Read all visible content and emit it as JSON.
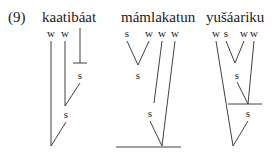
{
  "example_number": "(9)",
  "trees": [
    {
      "word": "kaatibáat",
      "word_pos": {
        "x": 42,
        "y": 9
      },
      "nodes": [
        {
          "label": "w",
          "x": 51,
          "y": 27
        },
        {
          "label": "w",
          "x": 65,
          "y": 27
        },
        {
          "label": "s",
          "x": 80,
          "y": 69
        },
        {
          "label": "s",
          "x": 66,
          "y": 108
        }
      ],
      "edges": [
        [
          80,
          28,
          80,
          63
        ],
        [
          73,
          63,
          87,
          63
        ],
        [
          51,
          41,
          51,
          146
        ],
        [
          65,
          41,
          65,
          106
        ],
        [
          80,
          83,
          65,
          106
        ],
        [
          66,
          122,
          51,
          146
        ]
      ]
    },
    {
      "word": "mámlakatun",
      "word_pos": {
        "x": 121,
        "y": 9
      },
      "nodes": [
        {
          "label": "s",
          "x": 127,
          "y": 27
        },
        {
          "label": "w",
          "x": 149,
          "y": 27
        },
        {
          "label": "w",
          "x": 162,
          "y": 27
        },
        {
          "label": "w",
          "x": 175,
          "y": 27
        },
        {
          "label": "s",
          "x": 138,
          "y": 69
        },
        {
          "label": "s",
          "x": 150,
          "y": 107
        }
      ],
      "edges": [
        [
          127,
          41,
          138,
          65
        ],
        [
          149,
          41,
          138,
          65
        ],
        [
          162,
          41,
          154,
          103
        ],
        [
          175,
          41,
          162,
          146
        ],
        [
          150,
          121,
          162,
          146
        ],
        [
          116,
          147,
          181,
          147
        ]
      ]
    },
    {
      "word": "yušáariku",
      "word_pos": {
        "x": 206,
        "y": 9
      },
      "nodes": [
        {
          "label": "w",
          "x": 216,
          "y": 27
        },
        {
          "label": "s",
          "x": 226,
          "y": 27
        },
        {
          "label": "w",
          "x": 244,
          "y": 27
        },
        {
          "label": "w",
          "x": 254,
          "y": 27
        },
        {
          "label": "s",
          "x": 237,
          "y": 69
        },
        {
          "label": "s",
          "x": 248,
          "y": 107
        }
      ],
      "edges": [
        [
          226,
          41,
          235,
          63
        ],
        [
          244,
          41,
          235,
          63
        ],
        [
          237,
          82,
          248,
          104
        ],
        [
          254,
          41,
          248,
          104
        ],
        [
          228,
          104,
          262,
          104
        ],
        [
          216,
          41,
          233,
          146
        ],
        [
          248,
          121,
          233,
          146
        ]
      ]
    }
  ],
  "colors": {
    "ink": "#2b2b2b",
    "background": "#ffffff"
  }
}
